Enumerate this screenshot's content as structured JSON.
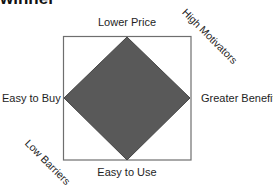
{
  "heading": {
    "text": "winner"
  },
  "diagram": {
    "type": "diamond-in-square",
    "square": {
      "x": 63,
      "y": 36,
      "width": 128,
      "height": 124,
      "stroke": "#6e6e6e",
      "fill": "#ffffff"
    },
    "diamond": {
      "fill": "#595959",
      "stroke": "#454545"
    },
    "axis_labels": {
      "top": "Lower Price",
      "bottom": "Easy to Use",
      "left": "Easy to Buy",
      "right": "Greater Benefits"
    },
    "corner_labels": {
      "top_right": "High Motivators",
      "bottom_left": "Low Barriers"
    }
  }
}
